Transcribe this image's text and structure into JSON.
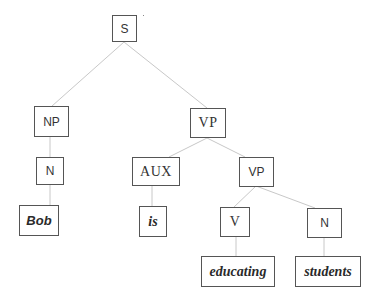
{
  "diagram": {
    "type": "syntax-tree",
    "sentence": "Bob is educating students",
    "colors": {
      "edge": "#c8c8c8",
      "box_border": "#555555",
      "text": "#333333"
    },
    "nodes": {
      "s": {
        "label": "S"
      },
      "np": {
        "label": "NP"
      },
      "vp": {
        "label": "VP"
      },
      "n1": {
        "label": "N"
      },
      "bob": {
        "label": "Bob"
      },
      "aux": {
        "label": "AUX"
      },
      "vp2": {
        "label": "VP"
      },
      "is": {
        "label": "is"
      },
      "v": {
        "label": "V"
      },
      "n2": {
        "label": "N"
      },
      "educating": {
        "label": "educating"
      },
      "students": {
        "label": "students"
      }
    },
    "edges": [
      [
        "S",
        "NP"
      ],
      [
        "S",
        "VP"
      ],
      [
        "NP",
        "N"
      ],
      [
        "N",
        "Bob"
      ],
      [
        "VP",
        "AUX"
      ],
      [
        "VP",
        "VP"
      ],
      [
        "AUX",
        "is"
      ],
      [
        "VP",
        "V"
      ],
      [
        "VP",
        "N"
      ],
      [
        "V",
        "educating"
      ],
      [
        "N",
        "students"
      ]
    ]
  }
}
